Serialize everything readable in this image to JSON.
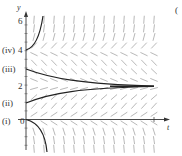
{
  "figure": {
    "panel_marker": "(",
    "axes": {
      "x_label": "t",
      "y_label": "y",
      "y_ticks": [
        {
          "value": 6,
          "label": "6"
        },
        {
          "value": 4,
          "label": "4"
        },
        {
          "value": 2,
          "label": "2"
        },
        {
          "value": 0,
          "label": "0"
        }
      ]
    },
    "curve_labels": [
      {
        "id": "i",
        "label": "(i)"
      },
      {
        "id": "ii",
        "label": "(ii)"
      },
      {
        "id": "iii",
        "label": "(iii)"
      },
      {
        "id": "iv",
        "label": "(iv)"
      }
    ],
    "equilibria": [
      0,
      2,
      4
    ],
    "colors": {
      "curve": "#222222",
      "field": "#888888",
      "axis": "#333333"
    }
  }
}
